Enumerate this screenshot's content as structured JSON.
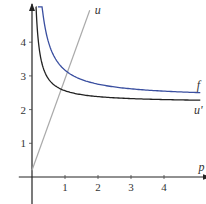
{
  "chart_data": {
    "type": "line",
    "title": "",
    "xlabel": "p",
    "ylabel": "",
    "xlim": [
      -0.4,
      5.2
    ],
    "ylim": [
      -0.8,
      5.1
    ],
    "x_ticks": [
      1,
      2,
      3,
      4
    ],
    "x_tick_labels": [
      "1",
      "2",
      "3",
      "4"
    ],
    "y_ticks": [
      1,
      2,
      3,
      4
    ],
    "y_tick_labels": [
      "1",
      "2",
      "3",
      "4"
    ],
    "grid": false,
    "series": [
      {
        "name": "u",
        "label": "u",
        "color": "#aaaaaa",
        "kind": "linear",
        "points": [
          [
            0,
            0.2
          ],
          [
            1.75,
            4.95
          ]
        ]
      },
      {
        "name": "f",
        "label": "f",
        "color": "#3a4fa0",
        "kind": "hyperbola",
        "asymptote": 2.34,
        "coef": 0.83,
        "x_start": 0.18,
        "x_end": 5.1
      },
      {
        "name": "u'",
        "label": "u'",
        "color": "#222222",
        "kind": "hyperbola",
        "asymptote": 2.21,
        "coef": 0.35,
        "x_start": 0.12,
        "x_end": 5.1
      }
    ]
  }
}
